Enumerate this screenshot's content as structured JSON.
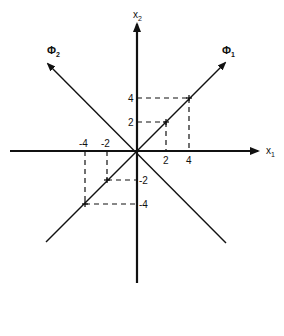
{
  "diagram": {
    "type": "coordinate-axes-with-principal-directions",
    "axes": {
      "x1": {
        "label": "x",
        "subscript": "1"
      },
      "x2": {
        "label": "x",
        "subscript": "2"
      }
    },
    "directions": {
      "phi1": {
        "label": "Φ",
        "subscript": "1"
      },
      "phi2": {
        "label": "Φ",
        "subscript": "2"
      }
    },
    "ticks": {
      "x1_positive": [
        "2",
        "4"
      ],
      "x1_negative": [
        "-4",
        "-2"
      ],
      "x2_positive": [
        "2",
        "4"
      ],
      "x2_negative": [
        "-2",
        "-4"
      ]
    },
    "points": [
      {
        "x": 2,
        "y": 2
      },
      {
        "x": 4,
        "y": 4
      },
      {
        "x": -2,
        "y": -2
      },
      {
        "x": -4,
        "y": -4
      }
    ],
    "colors": {
      "ink": "#111111",
      "background": "#ffffff"
    }
  }
}
